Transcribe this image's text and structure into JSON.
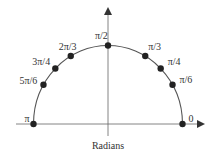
{
  "diagram": {
    "type": "unit-semicircle",
    "center": {
      "x": 108,
      "y": 124
    },
    "radius_x": 74.5,
    "radius_y": 78.5,
    "colors": {
      "line": "#555555",
      "point": "#222222",
      "text": "#333333",
      "background": "#ffffff"
    },
    "axis_label": "Radians",
    "points": [
      {
        "id": "0",
        "label": "0",
        "angle_deg": 0,
        "label_dx": 6,
        "label_dy": -2
      },
      {
        "id": "pi-6",
        "label": "π/6",
        "angle_deg": 30,
        "label_dx": 7,
        "label_dy": -2
      },
      {
        "id": "pi-4",
        "label": "π/4",
        "angle_deg": 45,
        "label_dx": 7,
        "label_dy": -3
      },
      {
        "id": "pi-3",
        "label": "π/3",
        "angle_deg": 60,
        "label_dx": 3,
        "label_dy": -6
      },
      {
        "id": "pi-2",
        "label": "π/2",
        "angle_deg": 90,
        "label_dx": -13,
        "label_dy": -7
      },
      {
        "id": "2pi-3",
        "label": "2π/3",
        "angle_deg": 120,
        "label_dx": -12,
        "label_dy": -6
      },
      {
        "id": "3pi-4",
        "label": "3π/4",
        "angle_deg": 135,
        "label_dx": -23,
        "label_dy": -3
      },
      {
        "id": "5pi-6",
        "label": "5π/6",
        "angle_deg": 150,
        "label_dx": -24,
        "label_dy": -1
      },
      {
        "id": "pi",
        "label": "π",
        "angle_deg": 180,
        "label_dx": -9,
        "label_dy": -2
      }
    ]
  }
}
